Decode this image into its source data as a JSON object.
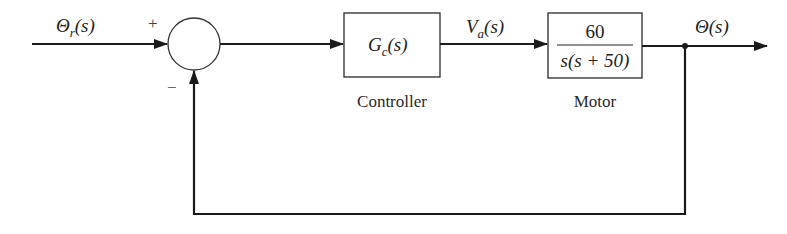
{
  "diagram": {
    "type": "closed-loop block diagram",
    "signals": {
      "input": {
        "base": "Θ",
        "sub": "r",
        "arg": "(s)"
      },
      "control": {
        "base": "V",
        "sub": "a",
        "arg": "(s)"
      },
      "output": {
        "base": "Θ",
        "arg": "(s)"
      }
    },
    "summing_junction": {
      "plus_sign": "+",
      "minus_sign": "−"
    },
    "blocks": [
      {
        "id": "controller",
        "tf_base": "G",
        "tf_sub": "c",
        "tf_arg": "(s)",
        "caption": "Controller"
      },
      {
        "id": "motor",
        "numerator": "60",
        "denominator": "s(s + 50)",
        "caption": "Motor"
      }
    ],
    "feedback": "unity negative feedback",
    "colors": {
      "line": "#1a1a1a",
      "background": "#ffffff"
    }
  }
}
